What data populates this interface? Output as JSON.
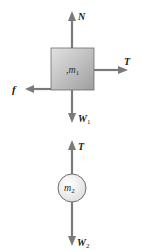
{
  "diagram": {
    "type": "free-body-diagram",
    "colors": {
      "arrow": "#7a7a7a",
      "block_fill_light": "#d8d8d8",
      "block_fill_dark": "#a8a8a8",
      "block_border": "#6e6e6e",
      "ball_fill": "#efefef",
      "ball_border": "#6e6e6e",
      "label": "#1a1a1a"
    },
    "block": {
      "mass_label": "m",
      "mass_subscript": "1",
      "forces": [
        {
          "name": "N",
          "symbol": "N",
          "subscript": "",
          "direction": "up"
        },
        {
          "name": "T",
          "symbol": "T",
          "subscript": "",
          "direction": "right"
        },
        {
          "name": "f",
          "symbol": "f",
          "subscript": "",
          "direction": "left"
        },
        {
          "name": "W1",
          "symbol": "W",
          "subscript": "1",
          "direction": "down"
        }
      ]
    },
    "ball": {
      "mass_label": "m",
      "mass_subscript": "2",
      "forces": [
        {
          "name": "T",
          "symbol": "T",
          "subscript": "",
          "direction": "up"
        },
        {
          "name": "W2",
          "symbol": "W",
          "subscript": "2",
          "direction": "down"
        }
      ]
    }
  }
}
